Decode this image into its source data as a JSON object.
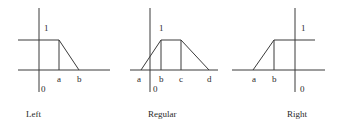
{
  "panels": [
    {
      "id": "left",
      "caption": "Left",
      "one_label": "1",
      "zero_label": "0",
      "points": [
        "a",
        "b"
      ]
    },
    {
      "id": "regular",
      "caption": "Regular",
      "one_label": "1",
      "zero_label": "0",
      "points": [
        "a",
        "b",
        "c",
        "d"
      ]
    },
    {
      "id": "right",
      "caption": "Right",
      "one_label": "1",
      "zero_label": "0",
      "points": [
        "a",
        "b"
      ]
    }
  ],
  "colors": {
    "line": "#3a3a3a",
    "text": "#2a2a2a",
    "background": "#ffffff"
  }
}
